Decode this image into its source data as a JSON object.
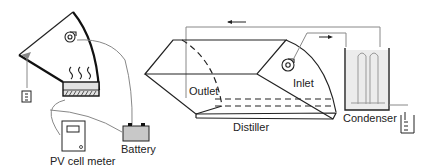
{
  "diagram": {
    "labels": {
      "pv_meter": "PV cell meter",
      "battery": "Battery",
      "outlet": "Outlet",
      "inlet": "Inlet",
      "distiller": "Distiller",
      "condenser": "Condenser"
    },
    "icons": [
      "fan-icon",
      "heat-waves-icon",
      "flask-icon",
      "battery-icon",
      "meter-icon",
      "arrow-left-icon",
      "arrow-right-icon",
      "condenser-coil-icon"
    ],
    "colors": {
      "line": "#222222",
      "wire": "#888888",
      "battery_fill": "#c8c8c8",
      "water_fill": "#e6e6e6"
    }
  }
}
